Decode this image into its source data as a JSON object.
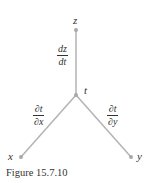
{
  "diagram": {
    "nodes": [
      {
        "id": "z",
        "label": "z"
      },
      {
        "id": "t",
        "label": "t"
      },
      {
        "id": "x",
        "label": "x"
      },
      {
        "id": "y",
        "label": "y"
      }
    ],
    "edges": [
      {
        "from": "t",
        "to": "z",
        "label_num": "dz",
        "label_den": "dt"
      },
      {
        "from": "t",
        "to": "x",
        "label_num": "∂t",
        "label_den": "∂x"
      },
      {
        "from": "t",
        "to": "y",
        "label_num": "∂t",
        "label_den": "∂y"
      }
    ],
    "colors": {
      "line": "#b3b3b3",
      "node": "#a8a8a8",
      "text": "#333333"
    }
  },
  "caption": "Figure 15.7.10"
}
